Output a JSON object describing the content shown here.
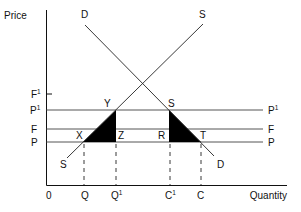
{
  "diagram": {
    "title": "",
    "axes": {
      "y_label": "Price",
      "x_label": "Quantity",
      "origin_label": "0"
    },
    "curves": [
      {
        "id": "demand",
        "label_start": "D",
        "label_end": "D"
      },
      {
        "id": "supply",
        "label_start": "S",
        "label_end": "S"
      }
    ],
    "price_levels": [
      {
        "id": "F1",
        "label": "F",
        "sup": "1",
        "drawn_as": "tick"
      },
      {
        "id": "P1",
        "label": "P",
        "sup": "1",
        "right_label": "P",
        "right_sup": "1",
        "drawn_as": "line"
      },
      {
        "id": "F",
        "label": "F",
        "sup": "",
        "right_label": "F",
        "right_sup": "",
        "drawn_as": "line"
      },
      {
        "id": "P",
        "label": "P",
        "sup": "",
        "right_label": "P",
        "right_sup": "",
        "drawn_as": "line"
      }
    ],
    "quantity_levels": [
      {
        "id": "Q",
        "label": "Q",
        "sup": ""
      },
      {
        "id": "Q1",
        "label": "Q",
        "sup": "1"
      },
      {
        "id": "C1",
        "label": "C",
        "sup": "1"
      },
      {
        "id": "C",
        "label": "C",
        "sup": ""
      }
    ],
    "points": {
      "X": "X",
      "Y": "Y",
      "Z": "Z",
      "S": "S",
      "R": "R",
      "T": "T"
    },
    "shaded_regions": [
      {
        "id": "triangle-xyz",
        "vertices": [
          "X",
          "Y",
          "Z"
        ],
        "color": "#000000"
      },
      {
        "id": "triangle-srt",
        "vertices": [
          "S",
          "R",
          "T"
        ],
        "color": "#000000"
      }
    ]
  }
}
